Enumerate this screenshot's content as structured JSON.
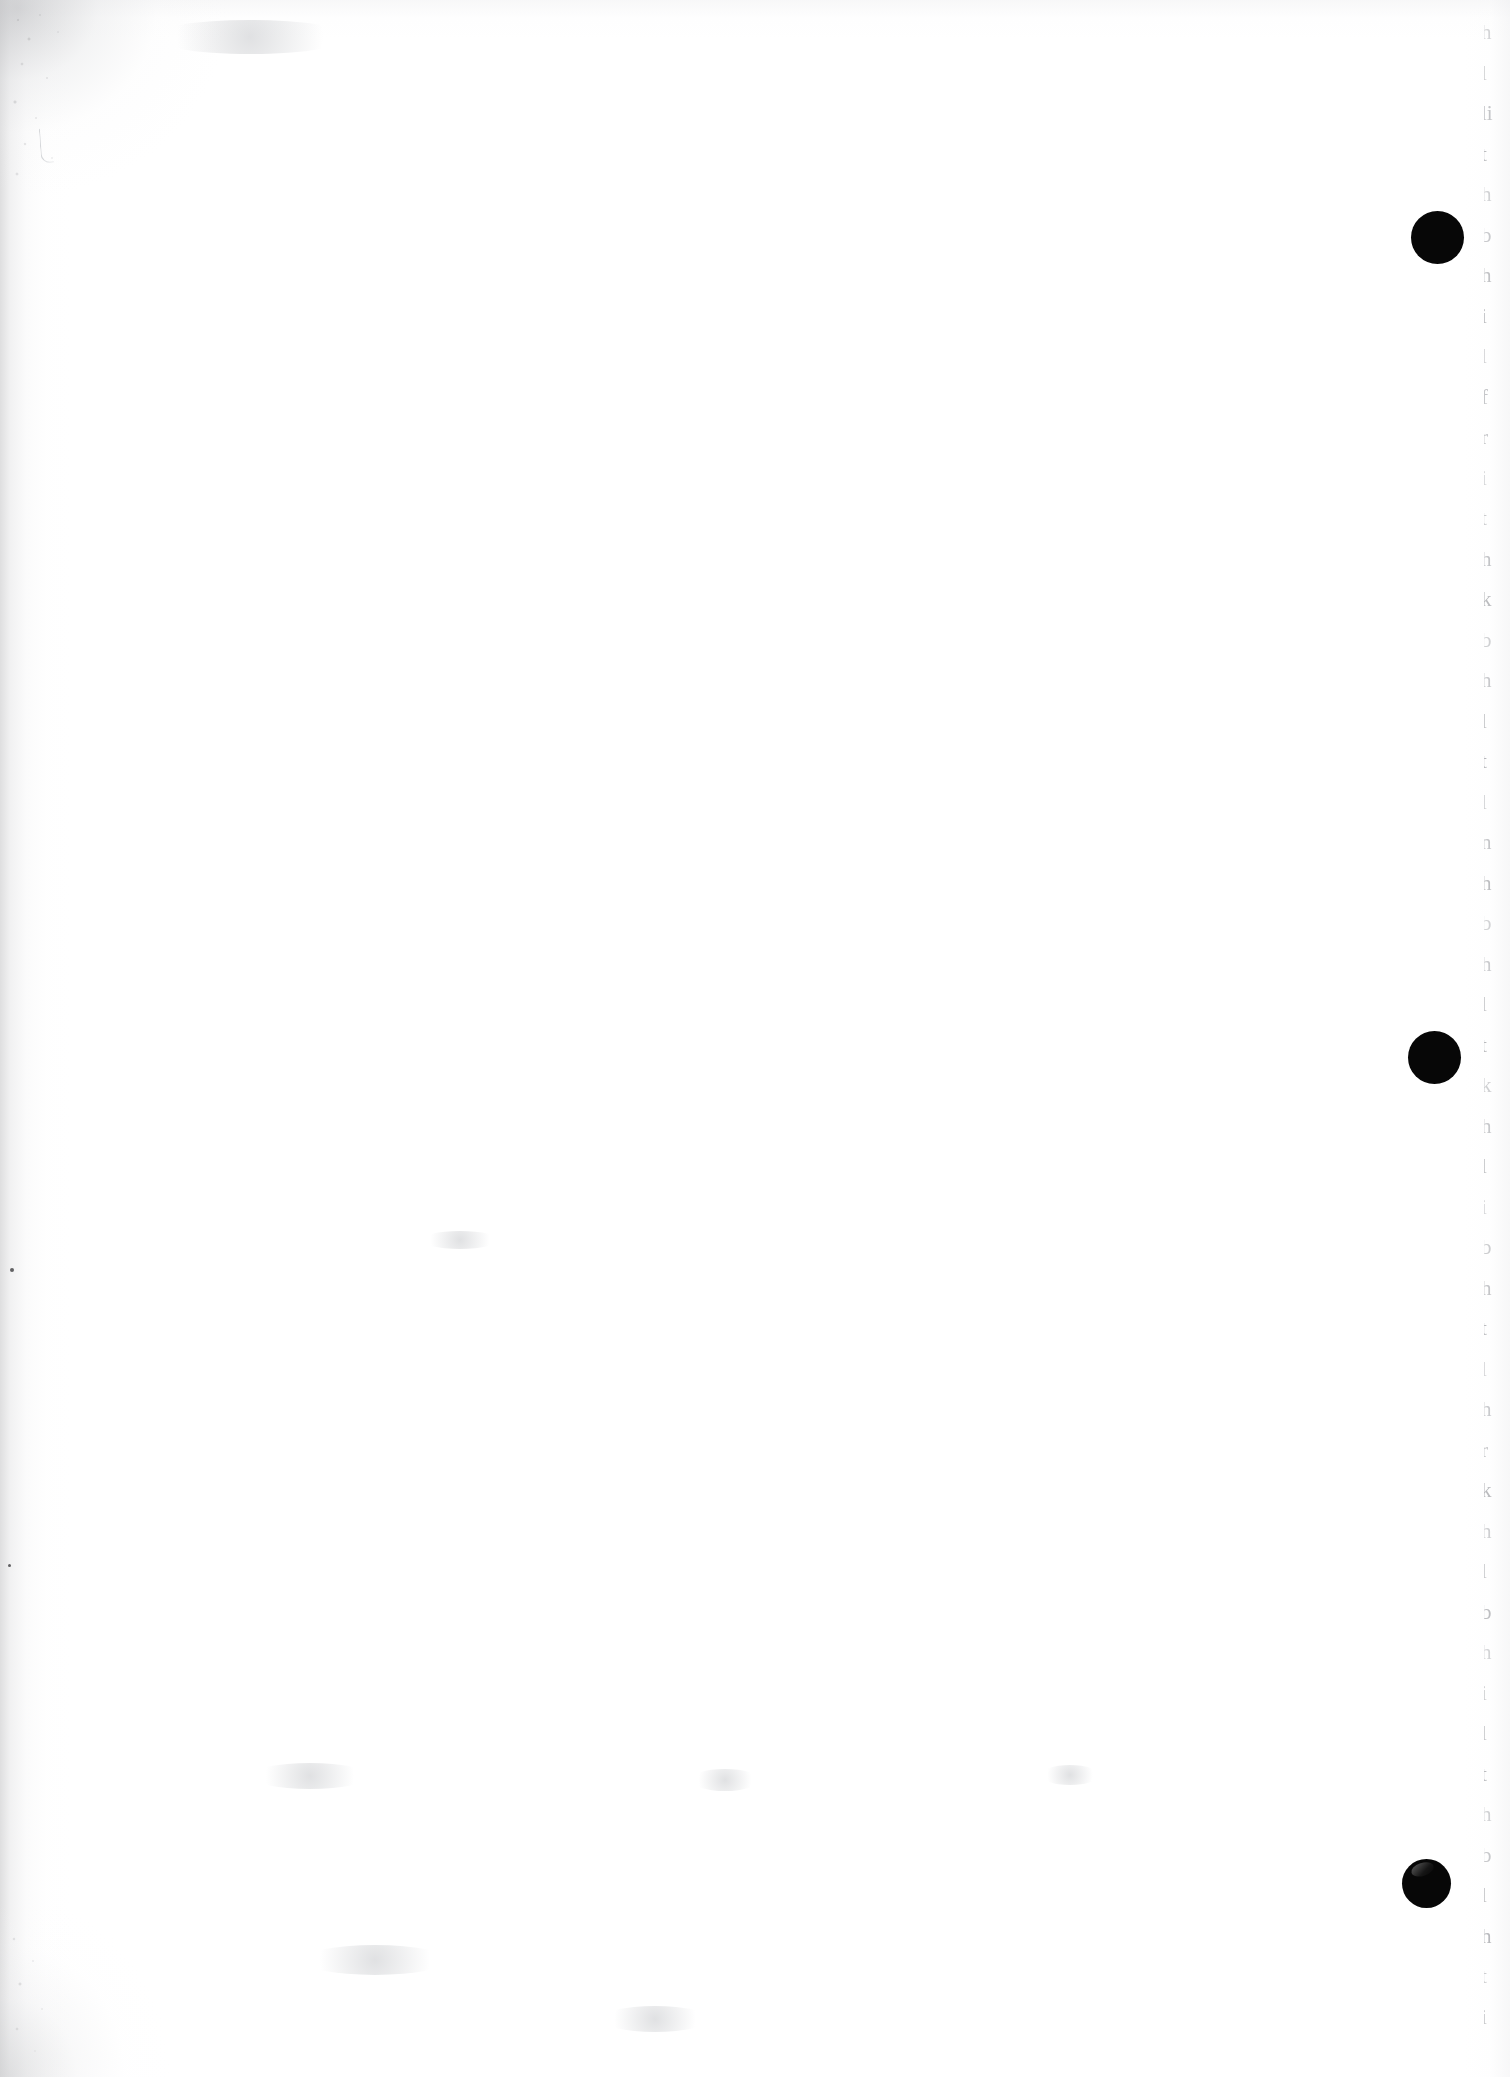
{
  "document": {
    "kind": "scanned-page",
    "page_state": "blank-verso",
    "width_px": 1510,
    "height_px": 2077,
    "background_color": "#ffffff",
    "ink_color": "#070707",
    "edge_text_color": "#969aa1",
    "scan_shadow_color": "#bebec0"
  },
  "marks": {
    "punch_dots": [
      {
        "name": "dot-top",
        "cx": 1437,
        "cy": 237,
        "d": 53,
        "glossy": false
      },
      {
        "name": "dot-middle",
        "cx": 1434,
        "cy": 1057,
        "d": 53,
        "glossy": false
      },
      {
        "name": "dot-bottom",
        "cx": 1426,
        "cy": 1883,
        "d": 49,
        "glossy": true
      }
    ],
    "specks": [
      {
        "x": 12,
        "y": 1270,
        "r": 2.2
      },
      {
        "x": 9,
        "y": 1565,
        "r": 1.6
      }
    ],
    "smudges": [
      {
        "x": 250,
        "y": 1775,
        "w": 120,
        "h": 26
      },
      {
        "x": 690,
        "y": 1780,
        "w": 70,
        "h": 22
      },
      {
        "x": 1040,
        "y": 1775,
        "w": 60,
        "h": 20
      },
      {
        "x": 300,
        "y": 1960,
        "w": 150,
        "h": 30
      },
      {
        "x": 600,
        "y": 2020,
        "w": 110,
        "h": 26
      },
      {
        "x": 420,
        "y": 1240,
        "w": 80,
        "h": 18
      }
    ]
  },
  "edge_text": {
    "description": "cut-off leading characters of the facing page's text lines along the right trim edge",
    "first_line_top": 22,
    "line_spacing": 40.5,
    "font_size": 21,
    "line_count": 50,
    "fragments": [
      "h",
      "l",
      "li",
      "t",
      "h",
      "b",
      "h",
      "i",
      "l",
      "f",
      "r",
      "i",
      "t",
      "h",
      "k",
      "b",
      "h",
      "l",
      "t",
      "l",
      "n",
      "h",
      "b",
      "h",
      "l",
      "t",
      "k",
      "h",
      "l",
      "i",
      "b",
      "h",
      "t",
      "l",
      "h",
      "r",
      "k",
      "h",
      "l",
      "b",
      "h",
      "i",
      "l",
      "t",
      "h",
      "b",
      "l",
      "h",
      "t",
      "i"
    ]
  }
}
